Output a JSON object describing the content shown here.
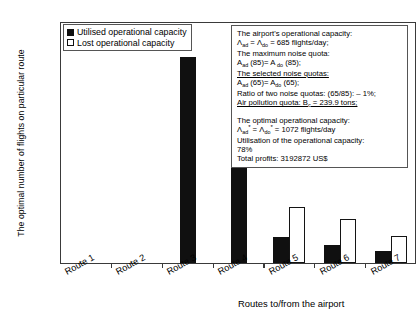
{
  "chart_data": {
    "type": "bar",
    "title": "",
    "xlabel": "Routes to/from the airport",
    "ylabel": "The optimal number of flights on particular route",
    "categories": [
      "Route 1",
      "Route 2",
      "Route 3",
      "Route 4",
      "Route 5",
      "Route 6",
      "Route 7"
    ],
    "series": [
      {
        "name": "Utilised operational capacity",
        "color": "#101010",
        "style": "filled",
        "values": [
          0,
          0,
          510,
          415,
          65,
          45,
          30
        ]
      },
      {
        "name": "Lost operational capacity",
        "color": "#ffffff",
        "style": "hollow",
        "values": [
          0,
          0,
          0,
          0,
          140,
          110,
          68
        ]
      }
    ],
    "ylim": [
      0,
      600
    ],
    "yticks": [
      0,
      100,
      200,
      300,
      400,
      500,
      600
    ],
    "ytick_labels": [
      "0",
      "100",
      "200",
      "300",
      "400",
      "500",
      "600"
    ],
    "grid": false,
    "legend_position": "top-left"
  },
  "legend": {
    "entries": [
      {
        "label": "Utilised operational capacity",
        "style": "filled"
      },
      {
        "label": "Lost operational capacity",
        "style": "hollow"
      }
    ]
  },
  "info_box": {
    "lines": [
      {
        "id": "l1",
        "html": "The airport's operational capacity:",
        "underline": false
      },
      {
        "id": "l2",
        "html": " Λ<sub>ad</sub> = Λ<sub>do</sub> = 685 flights/day;",
        "underline": false
      },
      {
        "id": "l3",
        "html": "The maximum noise quota:",
        "underline": false
      },
      {
        "id": "l4",
        "html": "A<sub>ad</sub> (85)= A <sub>do</sub> (85);",
        "underline": false
      },
      {
        "id": "l5",
        "html": "The selected noise quotas:",
        "underline": true
      },
      {
        "id": "l6",
        "html": "A<sub>ad</sub> (65)= A<sub>do</sub> (65);",
        "underline": false
      },
      {
        "id": "l7",
        "html": "Ratio of two noise quotas: (65/85): – 1%;",
        "underline": false
      },
      {
        "id": "l8",
        "html": "Air pollution quota: B<sub>c</sub> = 239.9 tons;",
        "underline": true
      },
      {
        "id": "l9",
        "html": "",
        "underline": false,
        "gap": true
      },
      {
        "id": "l10",
        "html": "The optimal operational capacity:",
        "underline": false
      },
      {
        "id": "l11",
        "html": "Λ<sub>ad</sub><sup>*</sup> = Λ<sub>do</sub><sup>*</sup> = 1072 flights/day",
        "underline": false
      },
      {
        "id": "l12",
        "html": "Utilisation of the operational capacity:",
        "underline": false
      },
      {
        "id": "l13",
        "html": " 78%",
        "underline": false
      },
      {
        "id": "l14",
        "html": "Total profits: 3192872 US$",
        "underline": false
      }
    ]
  }
}
